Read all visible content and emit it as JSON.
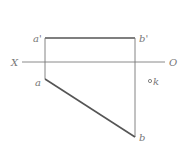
{
  "diagram": {
    "type": "orthographic-projection",
    "axis": {
      "left_label": "X",
      "right_label": "O"
    },
    "points": {
      "a_prime": "a'",
      "b_prime": "b'",
      "a": "a",
      "b": "b",
      "k": "k"
    },
    "colors": {
      "line": "#666666",
      "axis": "#888888",
      "label": "#777777"
    }
  }
}
